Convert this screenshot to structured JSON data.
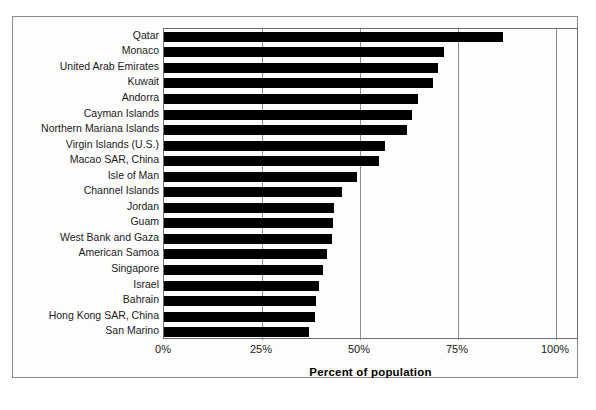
{
  "chart_data": {
    "type": "bar",
    "orientation": "horizontal",
    "title": "",
    "xlabel": "Percent of population",
    "ylabel": "",
    "xlim": [
      0,
      100
    ],
    "xticks": [
      "0%",
      "25%",
      "50%",
      "75%",
      "100%"
    ],
    "xtick_values": [
      0,
      25,
      50,
      75,
      100
    ],
    "grid": true,
    "grid_axis": "x",
    "legend": false,
    "bar_color": "#000000",
    "categories": [
      "Qatar",
      "Monaco",
      "United Arab Emirates",
      "Kuwait",
      "Andorra",
      "Cayman Islands",
      "Northern Mariana Islands",
      "Virgin Islands (U.S.)",
      "Macao SAR, China",
      "Isle of Man",
      "Channel Islands",
      "Jordan",
      "Guam",
      "West Bank and Gaza",
      "American Samoa",
      "Singapore",
      "Israel",
      "Bahrain",
      "Hong Kong SAR, China",
      "San Marino"
    ],
    "values": [
      86.5,
      71.4,
      69.9,
      68.6,
      64.8,
      63.3,
      62.0,
      56.3,
      54.8,
      49.2,
      45.4,
      43.4,
      43.1,
      42.9,
      41.7,
      40.5,
      39.6,
      38.8,
      38.6,
      37.0
    ]
  },
  "axis": {
    "x_title": "Percent of population"
  }
}
